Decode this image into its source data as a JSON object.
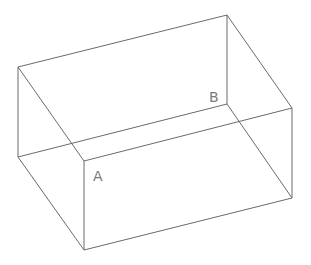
{
  "diagram": {
    "type": "wireframe-box",
    "vertices": {
      "back_top_left": [
        18,
        67
      ],
      "back_top_right": [
        227,
        15
      ],
      "back_bottom_left": [
        18,
        157
      ],
      "back_bottom_right": [
        227,
        104
      ],
      "front_top_left": [
        84,
        161
      ],
      "front_top_right": [
        292,
        108
      ],
      "front_bottom_left": [
        84,
        250
      ],
      "front_bottom_right": [
        292,
        198
      ]
    },
    "labels": [
      {
        "text": "A",
        "x": 93,
        "y": 181
      },
      {
        "text": "B",
        "x": 209,
        "y": 102
      }
    ]
  }
}
